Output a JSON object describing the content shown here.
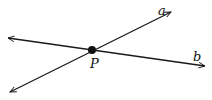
{
  "diagram": {
    "lines": [
      {
        "name": "a",
        "label": "a",
        "from": [
          10,
          92
        ],
        "to": [
          171,
          12
        ]
      },
      {
        "name": "b",
        "label": "b",
        "from": [
          8,
          38
        ],
        "to": [
          205,
          66
        ]
      }
    ],
    "point": {
      "label": "P",
      "x": 92,
      "y": 50
    },
    "colors": {
      "stroke": "#1a1a1a",
      "background": "#ffffff"
    }
  }
}
